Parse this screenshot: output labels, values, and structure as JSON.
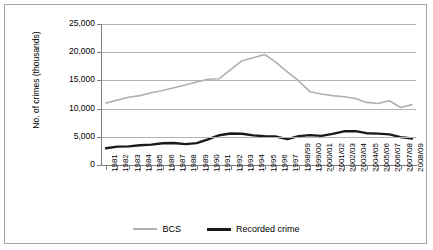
{
  "chart_data": {
    "type": "line",
    "title": "",
    "xlabel": "",
    "ylabel": "No. of crimes (thousands)",
    "ylim": [
      0,
      25000
    ],
    "ytick_values": [
      0,
      5000,
      10000,
      15000,
      20000,
      25000
    ],
    "ytick_labels": [
      "0",
      "5,000",
      "10,000",
      "15,000",
      "20,000",
      "25,000"
    ],
    "grid": true,
    "legend_position": "bottom",
    "categories": [
      "1981",
      "1982",
      "1983",
      "1984",
      "1985",
      "1986",
      "1987",
      "1988",
      "1989",
      "1990",
      "1991",
      "1992",
      "1993",
      "1994",
      "1995",
      "1996",
      "1997",
      "1998/99",
      "1999/00",
      "2000/01",
      "2001/02",
      "2002/03",
      "2003/04",
      "2004/05",
      "2005/06",
      "2006/07",
      "2007/08",
      "2008/09"
    ],
    "series": [
      {
        "name": "BCS",
        "color": "#b0b0b0",
        "values": [
          11000,
          11500,
          12000,
          12300,
          12800,
          13200,
          13700,
          14200,
          14700,
          15200,
          15300,
          16900,
          18500,
          19000,
          19600,
          18200,
          16500,
          14900,
          13000,
          12600,
          12300,
          12100,
          11800,
          11100,
          10900,
          11400,
          10200,
          10700
        ]
      },
      {
        "name": "Recorded crime",
        "color": "#1a1a1a",
        "values": [
          2960,
          3250,
          3300,
          3500,
          3610,
          3850,
          3890,
          3710,
          3870,
          4540,
          5280,
          5590,
          5530,
          5250,
          5100,
          5040,
          4600,
          5110,
          5300,
          5170,
          5530,
          5975,
          6010,
          5640,
          5560,
          5430,
          4950,
          4700
        ]
      }
    ]
  },
  "legend": {
    "entries": [
      {
        "label": "BCS"
      },
      {
        "label": "Recorded crime"
      }
    ]
  },
  "axis": {
    "y_title": "No. of crimes (thousands)"
  },
  "colors": {
    "bcs": "#b0b0b0",
    "recorded": "#1a1a1a",
    "grid": "#b3b3b3",
    "axis": "#7f7f7f",
    "frame": "#a6a6a6"
  }
}
